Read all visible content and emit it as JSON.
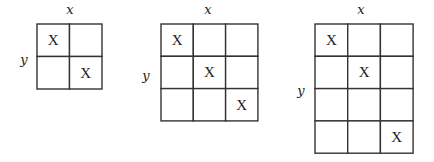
{
  "diagram": {
    "grids": [
      {
        "name": "grid-2x2",
        "x_label": "x",
        "y_label": "y",
        "rows": 2,
        "cols": 2,
        "origin": [
          37,
          24
        ],
        "cell_w": 32.5,
        "cell_h": 32.5,
        "x_label_pos": [
          70,
          14
        ],
        "y_label_pos": [
          24,
          64
        ],
        "mark": "X",
        "marked_cells": [
          [
            0,
            0
          ],
          [
            1,
            1
          ]
        ]
      },
      {
        "name": "grid-3x3",
        "x_label": "x",
        "y_label": "y",
        "rows": 3,
        "cols": 3,
        "origin": [
          161,
          24
        ],
        "cell_w": 32.3,
        "cell_h": 32.3,
        "x_label_pos": [
          208,
          14
        ],
        "y_label_pos": [
          146,
          80
        ],
        "mark": "X",
        "marked_cells": [
          [
            0,
            0
          ],
          [
            1,
            1
          ],
          [
            2,
            2
          ]
        ]
      },
      {
        "name": "grid-4x3",
        "x_label": "x",
        "y_label": "y",
        "rows": 4,
        "cols": 3,
        "origin": [
          315,
          24
        ],
        "cell_w": 32.7,
        "cell_h": 32.3,
        "x_label_pos": [
          361,
          14
        ],
        "y_label_pos": [
          301,
          95
        ],
        "mark": "X",
        "marked_cells": [
          [
            0,
            0
          ],
          [
            1,
            1
          ],
          [
            3,
            2
          ]
        ]
      }
    ]
  }
}
